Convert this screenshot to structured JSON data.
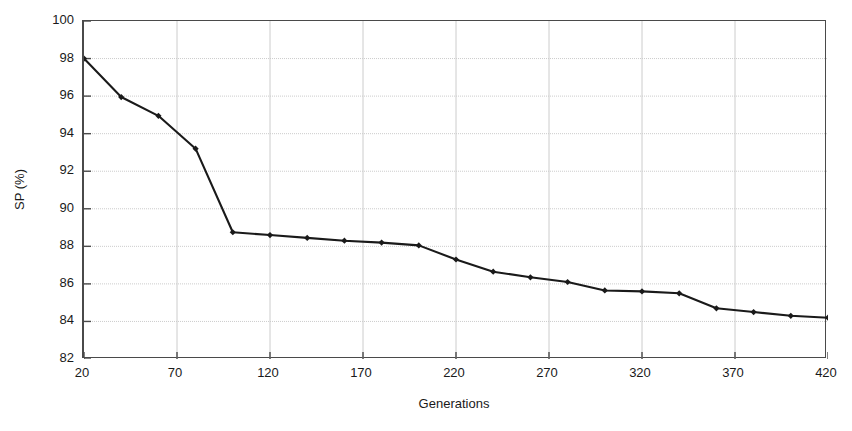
{
  "chart_data": {
    "type": "line",
    "title": "",
    "xlabel": "Generations",
    "ylabel": "SP (%)",
    "xlim": [
      20,
      420
    ],
    "ylim": [
      82,
      100
    ],
    "xticks": [
      20,
      70,
      120,
      170,
      220,
      270,
      320,
      370,
      420
    ],
    "yticks": [
      82,
      84,
      86,
      88,
      90,
      92,
      94,
      96,
      98,
      100
    ],
    "grid": true,
    "legend": null,
    "marker": "filled-diamond",
    "line_color": "#1a1a1a",
    "grid_color": "#cccccc",
    "axis_color": "#4a4a4a",
    "x": [
      20,
      40,
      60,
      80,
      100,
      120,
      140,
      160,
      180,
      200,
      220,
      240,
      260,
      280,
      300,
      320,
      340,
      360,
      380,
      400,
      420
    ],
    "values": [
      98.0,
      95.95,
      94.95,
      93.2,
      88.75,
      88.6,
      88.45,
      88.3,
      88.2,
      88.05,
      87.3,
      86.65,
      86.35,
      86.1,
      85.65,
      85.6,
      85.5,
      84.7,
      84.5,
      84.3,
      84.2
    ],
    "series": [
      {
        "name": "SP",
        "values": [
          98.0,
          95.95,
          94.95,
          93.2,
          88.75,
          88.6,
          88.45,
          88.3,
          88.2,
          88.05,
          87.3,
          86.65,
          86.35,
          86.1,
          85.65,
          85.6,
          85.5,
          84.7,
          84.5,
          84.3,
          84.2
        ]
      }
    ]
  },
  "axis": {
    "y_title": "SP (%)",
    "x_title": "Generations",
    "y_tick_labels": [
      "100",
      "98",
      "96",
      "94",
      "92",
      "90",
      "88",
      "86",
      "84",
      "82"
    ],
    "x_tick_labels": [
      "20",
      "70",
      "120",
      "170",
      "220",
      "270",
      "320",
      "370",
      "420"
    ]
  }
}
